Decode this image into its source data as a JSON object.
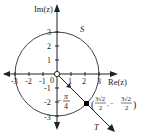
{
  "diagram": {
    "axes": {
      "x_label": "Re(z)",
      "y_label": "Im(z)",
      "origin_label": "0",
      "x_ticks": [
        "-3",
        "-2",
        "-1",
        "1",
        "2",
        "3"
      ],
      "y_ticks": [
        "3",
        "2",
        "1",
        "-1",
        "-2",
        "-3"
      ]
    },
    "curve_label": "S",
    "line_label": "T",
    "angle_label": {
      "sign": "−",
      "numerator": "π",
      "denominator": "4"
    },
    "point_label": {
      "open": "(",
      "x_num": "3√2",
      "x_den": "2",
      "sep": ", −",
      "y_num": "3√2",
      "y_den": "2",
      "close": ")"
    },
    "colors": {
      "stroke": "#333333",
      "point_fill": "#000000",
      "origin_fill": "#ffffff"
    }
  }
}
